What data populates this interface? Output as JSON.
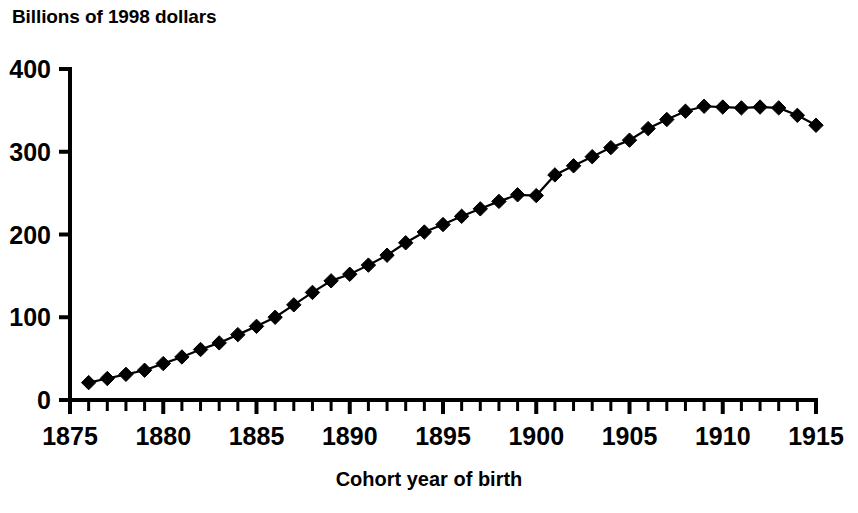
{
  "chart_data": {
    "type": "line",
    "title": "Billions of 1998 dollars",
    "xlabel": "Cohort year of birth",
    "ylabel": "Billions of 1998 dollars",
    "grid": false,
    "legend": null,
    "marker": "diamond",
    "marker_color": "#000000",
    "line_color": "#000000",
    "xlim": [
      1875,
      1915
    ],
    "ylim": [
      0,
      400
    ],
    "xticks": [
      1875,
      1880,
      1885,
      1890,
      1895,
      1900,
      1905,
      1910,
      1915
    ],
    "xtick_labels": [
      "1875",
      "1880",
      "1885",
      "1890",
      "1895",
      "1900",
      "1905",
      "1910",
      "1915"
    ],
    "x_minor_tick_step": 1,
    "yticks": [
      0,
      100,
      200,
      300,
      400
    ],
    "ytick_labels": [
      "0",
      "100",
      "200",
      "300",
      "400"
    ],
    "x": [
      1876,
      1877,
      1878,
      1879,
      1880,
      1881,
      1882,
      1883,
      1884,
      1885,
      1886,
      1887,
      1888,
      1889,
      1890,
      1891,
      1892,
      1893,
      1894,
      1895,
      1896,
      1897,
      1898,
      1899,
      1900,
      1901,
      1902,
      1903,
      1904,
      1905,
      1906,
      1907,
      1908,
      1909,
      1910,
      1911,
      1912,
      1913,
      1914,
      1915
    ],
    "values": [
      21,
      26,
      31,
      36,
      44,
      52,
      61,
      69,
      79,
      89,
      100,
      115,
      130,
      144,
      152,
      163,
      175,
      190,
      203,
      212,
      222,
      231,
      240,
      248,
      247,
      272,
      283,
      294,
      305,
      314,
      328,
      339,
      349,
      355,
      354,
      353,
      354,
      353,
      344,
      332
    ],
    "series": [
      {
        "name": "Lifetime earnings by cohort",
        "values": [
          21,
          26,
          31,
          36,
          44,
          52,
          61,
          69,
          79,
          89,
          100,
          115,
          130,
          144,
          152,
          163,
          175,
          190,
          203,
          212,
          222,
          231,
          240,
          248,
          247,
          272,
          283,
          294,
          305,
          314,
          328,
          339,
          349,
          355,
          354,
          353,
          354,
          353,
          344,
          332
        ]
      }
    ]
  }
}
